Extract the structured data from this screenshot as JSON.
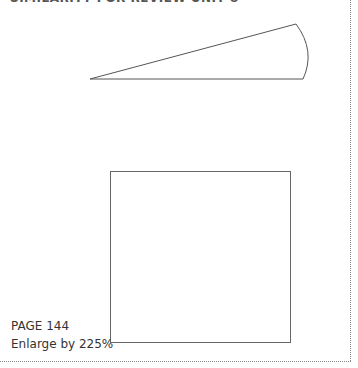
{
  "header": {
    "title": "SIMILARITY FOR REVIEW UNIT 8"
  },
  "figures": {
    "sector": {
      "shape": "circular-sector",
      "stroke_color": "#555555"
    },
    "square": {
      "shape": "square",
      "stroke_color": "#666666"
    }
  },
  "footer": {
    "page_label": "PAGE 144",
    "enlarge_label": "Enlarge by 225%"
  },
  "colors": {
    "text": "#333333",
    "border": "#888888"
  }
}
